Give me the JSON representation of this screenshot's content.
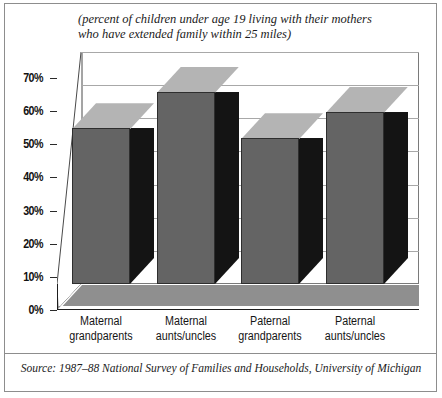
{
  "subtitle": {
    "line1": "(percent of children under age 19 living with their mothers",
    "line2": "who have extended family within 25 miles)"
  },
  "source": "Source: 1987–88 National Survey of Families and Households, University of Michigan",
  "colors": {
    "bar_front": "#646464",
    "bar_side": "#141414",
    "bar_top": "#b4b4b4",
    "floor": "#8f8f8f",
    "gridline": "#a8a8a8",
    "axis": "#1d1d1d",
    "frame": "#8d8d8d",
    "text": "#151515"
  },
  "chart_data": {
    "type": "bar",
    "title": "",
    "subtitle": "(percent of children under age 19 living with their mothers who have extended family within 25 miles)",
    "categories": [
      "Maternal grandparents",
      "Maternal aunts/uncles",
      "Paternal grandparents",
      "Paternal aunts/uncles"
    ],
    "category_lines": [
      [
        "Maternal",
        "grandparents"
      ],
      [
        "Maternal",
        "aunts/uncles"
      ],
      [
        "Paternal",
        "grandparents"
      ],
      [
        "Paternal",
        "aunts/uncles"
      ]
    ],
    "values": [
      47,
      58,
      44,
      52
    ],
    "xlabel": "",
    "ylabel": "",
    "ylim": [
      0,
      70
    ],
    "ytick_values": [
      0,
      10,
      20,
      30,
      40,
      50,
      60,
      70
    ],
    "ytick_labels": [
      "0%",
      "10%",
      "20%",
      "30%",
      "40%",
      "50%",
      "60%",
      "70%"
    ],
    "grid": true,
    "legend": false,
    "style": "3d-column",
    "source": "Source: 1987–88 National Survey of Families and Households, University of Michigan"
  }
}
